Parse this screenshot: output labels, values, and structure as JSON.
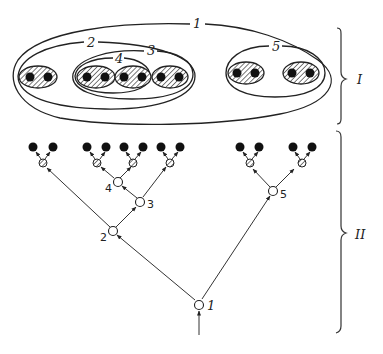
{
  "figure": {
    "part_labels": {
      "upper": "I",
      "lower": "II"
    },
    "colors": {
      "ink": "#222222",
      "background": "#ffffff",
      "hatch": "#333333"
    },
    "upper": {
      "description": "Nested set (Venn/Euler) representation",
      "sets": [
        {
          "id": "1",
          "label": "1",
          "contains": [
            "2",
            "5"
          ]
        },
        {
          "id": "2",
          "label": "2",
          "contains": [
            "pairA",
            "3"
          ]
        },
        {
          "id": "3",
          "label": "3",
          "contains": [
            "4",
            "pairD"
          ]
        },
        {
          "id": "4",
          "label": "4",
          "contains": [
            "pairB",
            "pairC"
          ]
        },
        {
          "id": "5",
          "label": "5",
          "contains": [
            "pairE",
            "pairF"
          ]
        }
      ],
      "pairs": [
        "pairA",
        "pairB",
        "pairC",
        "pairD",
        "pairE",
        "pairF"
      ]
    },
    "lower": {
      "description": "Branching tree (dendrogram) representation",
      "nodes": [
        {
          "id": "1",
          "label": "1",
          "children": [
            "2",
            "5"
          ]
        },
        {
          "id": "2",
          "label": "2",
          "children": [
            "hA",
            "3"
          ]
        },
        {
          "id": "3",
          "label": "3",
          "children": [
            "4",
            "hD"
          ]
        },
        {
          "id": "4",
          "label": "4",
          "children": [
            "hB",
            "hC"
          ]
        },
        {
          "id": "5",
          "label": "5",
          "children": [
            "hE",
            "hF"
          ]
        }
      ],
      "terminal_pairs": 6
    }
  }
}
